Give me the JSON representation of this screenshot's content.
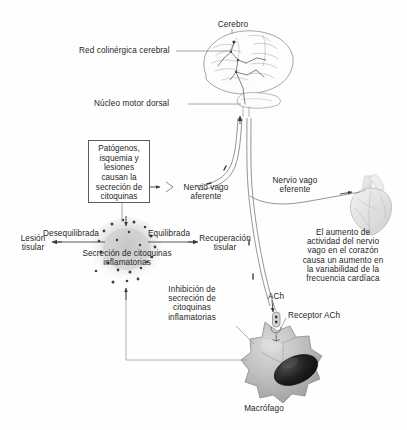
{
  "diagram": {
    "background": "#fefefe",
    "ink": "#2b2b2b"
  },
  "labels": {
    "cerebro": "Cerebro",
    "red_colinergica": "Red colinérgica cerebral",
    "nucleo_motor_dorsal": "Núcleo motor dorsal",
    "nervio_vago_aferente": "Nervio vago\naferente",
    "nervio_vago_aferente_l1": "Nervio vago",
    "nervio_vago_aferente_l2": "aferente",
    "nervio_vago_eferente_l1": "Nervio vago",
    "nervio_vago_eferente_l2": "eferente",
    "lesion_tisular_l1": "Lesión",
    "lesion_tisular_l2": "tisular",
    "desequilibrada": "Desequilibrada",
    "equilibrada": "Equilibrada",
    "recuperacion_l1": "Recuperación",
    "recuperacion_l2": "tisular",
    "secrecion_l1": "Secreción de citoquinas",
    "secrecion_l2": "inflamatorias",
    "ach": "ACh",
    "receptor_ach": "Receptor ACh",
    "macrofago": "Macrófago"
  },
  "boxes": {
    "patogenos": {
      "lines": [
        "Patógenos,",
        "isquemia y",
        "lesiones",
        "causan la",
        "secreción de",
        "citoquinas"
      ]
    }
  },
  "blocks": {
    "corazon": {
      "lines": [
        "El aumento de",
        "actividad del nervio",
        "vago en el corazón",
        "causa un aumento en",
        "la variabilidad de la",
        "frecuencia cardíaca"
      ]
    },
    "inhibicion": {
      "lines": [
        "Inhibición de",
        "secreción de",
        "citoquinas",
        "inflamatorias"
      ]
    }
  },
  "figures": {
    "brain": "brain-illustration",
    "heart": "heart-illustration",
    "macrophage": "macrophage-cell",
    "cytokine_cloud": "cytokine-cloud",
    "ach_receptor": "ach-receptor-icon",
    "ach_vesicle": "ach-vesicle-icon"
  },
  "colors": {
    "line": "#6e6e6e",
    "box_border": "#5c5c5c",
    "cell_fill": "#b9b9b9",
    "cell_edge": "#8d8d8d",
    "nucleus": "#1d1d1d",
    "cloud": "#c9c9c9",
    "particle": "#4a4a4a",
    "heart": "#dedede",
    "brain": "#8a8a8a"
  }
}
